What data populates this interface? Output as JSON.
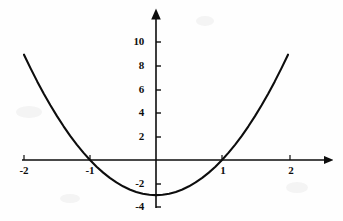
{
  "figure": {
    "width": 343,
    "height": 221,
    "background_color": "#fefefe",
    "ink_color": "#0d0d0d"
  },
  "chart_data": {
    "type": "line",
    "title": "",
    "subtitle": "",
    "xlabel": "",
    "ylabel": "",
    "grid": false,
    "legend": null,
    "function": "y = 3x^2 - 3",
    "xlim": [
      -2.2,
      2.65
    ],
    "ylim": [
      -4.2,
      11.2
    ],
    "x_ticks": [
      -2,
      -1,
      1,
      2
    ],
    "x_tick_labels": [
      "-2",
      "-1",
      "1",
      "2"
    ],
    "y_ticks": [
      10,
      8,
      6,
      4,
      2,
      -2,
      -4
    ],
    "y_tick_labels": [
      "10",
      "8",
      "6",
      "4",
      "2",
      "-2",
      "-4"
    ],
    "roots": [
      -1,
      1
    ],
    "vertex": [
      0,
      -3
    ],
    "series": [
      {
        "name": "y = 3x^2 - 3",
        "x": [
          -2.0,
          -1.9,
          -1.8,
          -1.7,
          -1.6,
          -1.5,
          -1.4,
          -1.3,
          -1.2,
          -1.1,
          -1.0,
          -0.9,
          -0.8,
          -0.7,
          -0.6,
          -0.5,
          -0.4,
          -0.3,
          -0.2,
          -0.1,
          0.0,
          0.1,
          0.2,
          0.3,
          0.4,
          0.5,
          0.6,
          0.7,
          0.8,
          0.9,
          1.0,
          1.1,
          1.2,
          1.3,
          1.4,
          1.5,
          1.6,
          1.7,
          1.8,
          1.9,
          2.0
        ],
        "y": [
          9.0,
          7.83,
          6.72,
          5.67,
          4.68,
          3.75,
          2.88,
          2.07,
          1.32,
          0.63,
          0.0,
          -0.57,
          -1.08,
          -1.53,
          -1.92,
          -2.25,
          -2.52,
          -2.73,
          -2.88,
          -2.97,
          -3.0,
          -2.97,
          -2.88,
          -2.73,
          -2.52,
          -2.25,
          -1.92,
          -1.53,
          -1.08,
          -0.57,
          0.0,
          0.63,
          1.32,
          2.07,
          2.88,
          3.75,
          4.68,
          5.67,
          6.72,
          7.83,
          9.0
        ]
      }
    ]
  },
  "axes": {
    "x_axis_name": "x-axis",
    "y_axis_name": "y-axis",
    "x_arrow": true,
    "y_arrow": true
  },
  "tick_labels": {
    "y": [
      {
        "text": "10",
        "value": 10
      },
      {
        "text": "8",
        "value": 8
      },
      {
        "text": "6",
        "value": 6
      },
      {
        "text": "4",
        "value": 4
      },
      {
        "text": "2",
        "value": 2
      },
      {
        "text": "-2",
        "value": -2
      },
      {
        "text": "-4",
        "value": -4
      }
    ],
    "x": [
      {
        "text": "-2",
        "value": -2
      },
      {
        "text": "-1",
        "value": -1
      },
      {
        "text": "1",
        "value": 1
      },
      {
        "text": "2",
        "value": 2
      }
    ]
  }
}
